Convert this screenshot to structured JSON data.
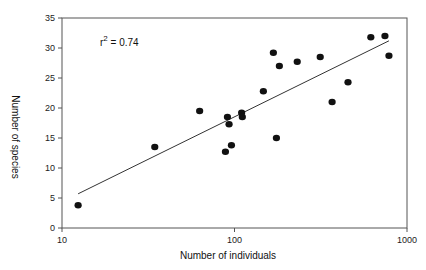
{
  "chart_data": {
    "type": "scatter",
    "title": "",
    "xlabel": "Number of individuals",
    "ylabel": "Number of species",
    "xscale": "log",
    "xlim": [
      10,
      1000
    ],
    "ylim": [
      0,
      35
    ],
    "xticks": [
      10,
      100,
      1000
    ],
    "xtick_labels": [
      "10",
      "100",
      "1000"
    ],
    "yticks": [
      0,
      5,
      10,
      15,
      20,
      25,
      30,
      35
    ],
    "ytick_labels": [
      "0",
      "5",
      "10",
      "15",
      "20",
      "25",
      "30",
      "35"
    ],
    "grid": false,
    "legend": null,
    "annotation": {
      "text_base": "r",
      "text_sup": "2",
      "text_rest": " = 0.74",
      "x": 13.5,
      "y": 31.2
    },
    "series": [
      {
        "name": "observations",
        "marker": "filled-circle",
        "x": [
          12.4,
          34.5,
          62.8,
          91,
          93,
          88.6,
          96,
          110,
          111,
          147,
          168,
          175,
          182,
          231,
          314,
          368,
          455,
          617,
          745,
          786
        ],
        "y": [
          3.8,
          13.5,
          19.5,
          18.5,
          17.3,
          12.7,
          13.8,
          19.2,
          18.5,
          22.8,
          29.2,
          15.0,
          27.0,
          27.7,
          28.5,
          21.0,
          24.3,
          31.8,
          32.0,
          28.7
        ]
      }
    ],
    "fit_line": {
      "name": "regression",
      "x": [
        12.4,
        786
      ],
      "y": [
        5.7,
        31.2
      ]
    }
  },
  "colors": {
    "points": "#111111",
    "axis": "#555555",
    "line": "#333333"
  }
}
